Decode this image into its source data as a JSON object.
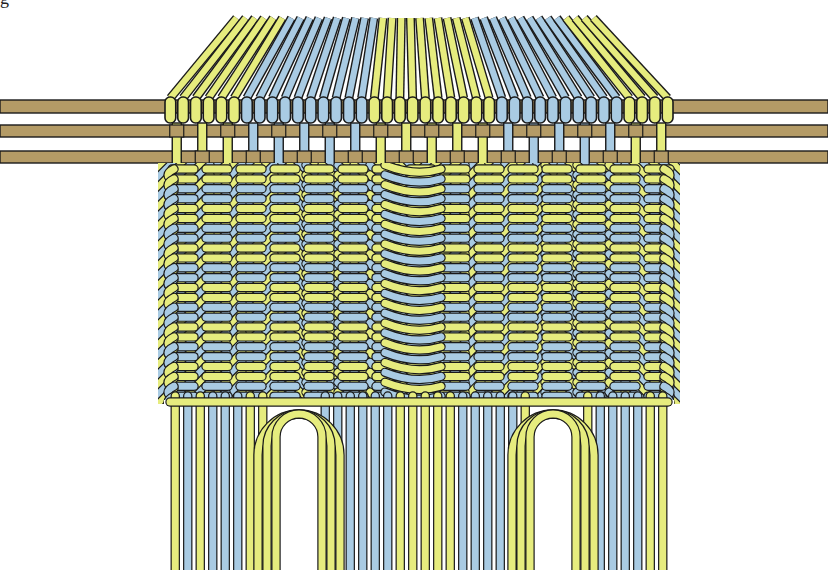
{
  "figure": {
    "caption_fragment": "g"
  },
  "colors": {
    "yellow_cord": "#E6EC7E",
    "blue_cord": "#A9CBE3",
    "rod": "#B49B66",
    "outline": "#1a1a1a",
    "background": "#ffffff"
  },
  "rods": [
    {
      "y": 100,
      "h": 13
    },
    {
      "y": 125,
      "h": 12
    },
    {
      "y": 151,
      "h": 12
    }
  ],
  "header": {
    "x_start": 164,
    "x_end": 674,
    "loop_count": 40,
    "pattern": [
      "Y",
      "Y",
      "Y",
      "Y",
      "Y",
      "Y",
      "B",
      "B",
      "B",
      "B",
      "B",
      "B",
      "B",
      "B",
      "B",
      "B",
      "Y",
      "Y",
      "Y",
      "Y",
      "Y",
      "Y",
      "Y",
      "Y",
      "Y",
      "Y",
      "B",
      "B",
      "B",
      "B",
      "B",
      "B",
      "B",
      "B",
      "B",
      "B",
      "Y",
      "Y",
      "Y",
      "Y"
    ]
  },
  "fan": {
    "top_left": 232,
    "top_right": 598,
    "top_y": 18,
    "bottom_y": 98
  },
  "weave": {
    "top": 165,
    "bottom": 402,
    "left": 164,
    "right": 674,
    "rows": 12,
    "chevron_centers": [
      290,
      545
    ],
    "v_center": 415
  },
  "fringe": {
    "top": 400,
    "bottom": 570,
    "loops": [
      {
        "x_left": 276,
        "x_right": 322
      },
      {
        "x_left": 530,
        "x_right": 576
      }
    ],
    "strand_pattern": [
      "Y",
      "B",
      "Y",
      "B",
      "B",
      "B",
      "Y",
      "Y",
      "Y",
      "Y",
      "Y",
      "Y",
      "B",
      "B",
      "B",
      "B",
      "B",
      "B",
      "Y",
      "Y",
      "Y",
      "Y",
      "Y",
      "B",
      "B",
      "B",
      "B",
      "B",
      "Y",
      "Y",
      "Y",
      "Y",
      "Y",
      "Y",
      "B",
      "B",
      "B",
      "B",
      "Y",
      "Y"
    ]
  }
}
